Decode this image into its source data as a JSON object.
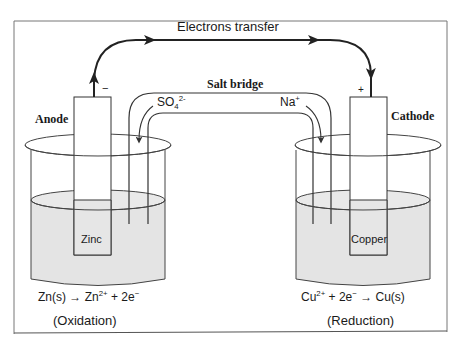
{
  "diagram": {
    "type": "galvanic-cell",
    "title": "Electrons transfer",
    "salt_bridge": {
      "label": "Salt bridge",
      "anion": {
        "base": "SO",
        "sub": "4",
        "sup": "2-"
      },
      "cation": {
        "base": "Na",
        "sup": "+"
      }
    },
    "anode": {
      "label": "Anode",
      "polarity": "−",
      "electrode": "Zinc",
      "reaction": {
        "left": "Zn(s)",
        "arrow": "→",
        "product": "Zn",
        "product_sup": "2+",
        "rest": "+ 2e",
        "rest_sup": "−"
      },
      "process": "(Oxidation)"
    },
    "cathode": {
      "label": "Cathode",
      "polarity": "+",
      "electrode": "Copper",
      "reaction": {
        "reactant": "Cu",
        "reactant_sup": "2+",
        "mid": "+ 2e",
        "mid_sup": "−",
        "arrow": "→",
        "right": "Cu(s)"
      },
      "process": "(Reduction)"
    },
    "colors": {
      "line": "#2a2a2a",
      "solution": "#e6e6e6",
      "background": "#ffffff",
      "frame": "#6a6a6a"
    }
  }
}
